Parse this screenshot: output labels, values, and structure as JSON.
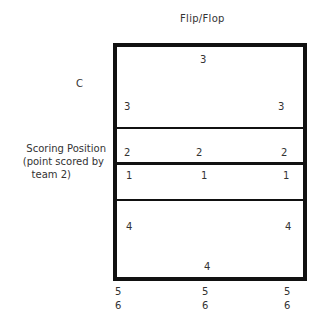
{
  "title": "Flip/Flop",
  "left_label": "C",
  "side_note": {
    "line1": "Scoring Position",
    "line2": "(point scored by",
    "line3": "team 2)"
  },
  "positions": {
    "top_center": "3",
    "row3_left": "3",
    "row3_right": "3",
    "row2_left": "2",
    "row2_center": "2",
    "row2_right": "2",
    "row1_left": "1",
    "row1_center": "1",
    "row1_right": "1",
    "row4_left": "4",
    "row4_right": "4",
    "bottom_center": "4"
  },
  "below_court": {
    "left": [
      "5",
      "6"
    ],
    "center": [
      "5",
      "6"
    ],
    "right": [
      "5",
      "6"
    ]
  },
  "colors": {
    "lines": "#111111",
    "text": "#333333"
  }
}
